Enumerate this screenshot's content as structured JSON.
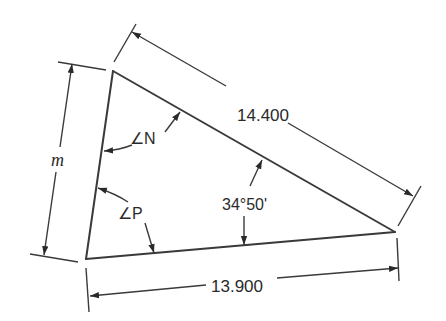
{
  "diagram": {
    "type": "triangle-dimension-drawing",
    "vertices": {
      "top": [
        113,
        71
      ],
      "right": [
        395,
        232
      ],
      "bottom_left": [
        86,
        259
      ]
    },
    "dimensions": {
      "hypotenuse": {
        "label": "14.400"
      },
      "base": {
        "label": "13.900"
      },
      "left_side": {
        "label": "m"
      }
    },
    "angles": {
      "top": {
        "label": "∠N"
      },
      "bottom_left": {
        "label": "∠P"
      },
      "right": {
        "label": "34°50'"
      }
    },
    "colors": {
      "line": "#3a3a3a",
      "text": "#2a2a2a",
      "background": "#ffffff"
    }
  }
}
